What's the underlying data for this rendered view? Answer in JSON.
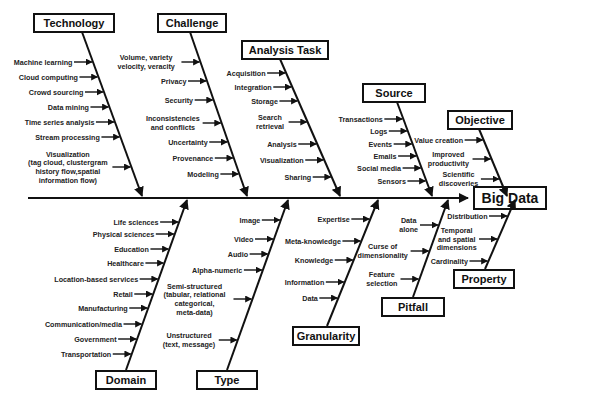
{
  "title": "Big Data",
  "spine": {
    "y": 198,
    "x_start": 28,
    "x_end": 468
  },
  "head": {
    "label": "Big Data",
    "x": 474,
    "y": 187,
    "w": 72,
    "h": 22
  },
  "top_categories": [
    {
      "label": "Technology",
      "box": [
        34,
        14,
        80,
        18
      ],
      "bone": [
        82,
        32,
        142,
        196
      ],
      "items": [
        {
          "lines": [
            "Machine learning"
          ],
          "y": 62
        },
        {
          "lines": [
            "Cloud computing"
          ],
          "y": 77
        },
        {
          "lines": [
            "Crowd sourcing"
          ],
          "y": 92
        },
        {
          "lines": [
            "Data mining"
          ],
          "y": 107
        },
        {
          "lines": [
            "Time series analysis"
          ],
          "y": 122
        },
        {
          "lines": [
            "Stream processing"
          ],
          "y": 137
        },
        {
          "lines": [
            "Visualization",
            "(tag cloud, clustergram",
            "history flow,spatial",
            "information flow)"
          ],
          "y": 167
        }
      ]
    },
    {
      "label": "Challenge",
      "box": [
        158,
        14,
        68,
        18
      ],
      "bone": [
        190,
        32,
        247,
        196
      ],
      "items": [
        {
          "lines": [
            "Volume, variety",
            "velocity, veracity"
          ],
          "y": 62
        },
        {
          "lines": [
            "Privacy"
          ],
          "y": 81
        },
        {
          "lines": [
            "Security"
          ],
          "y": 100
        },
        {
          "lines": [
            "Inconsistencies",
            "and conflicts"
          ],
          "y": 123
        },
        {
          "lines": [
            "Uncertainty"
          ],
          "y": 142
        },
        {
          "lines": [
            "Provenance"
          ],
          "y": 158
        },
        {
          "lines": [
            "Modeling"
          ],
          "y": 174
        }
      ]
    },
    {
      "label": "Analysis Task",
      "box": [
        242,
        41,
        86,
        18
      ],
      "bone": [
        280,
        59,
        340,
        196
      ],
      "items": [
        {
          "lines": [
            "Acquisition"
          ],
          "y": 73
        },
        {
          "lines": [
            "Integration"
          ],
          "y": 87
        },
        {
          "lines": [
            "Storage"
          ],
          "y": 101
        },
        {
          "lines": [
            "Search",
            "retrieval"
          ],
          "y": 122
        },
        {
          "lines": [
            "Analysis"
          ],
          "y": 144
        },
        {
          "lines": [
            "Visualization"
          ],
          "y": 160
        },
        {
          "lines": [
            "Sharing"
          ],
          "y": 177
        }
      ]
    },
    {
      "label": "Source",
      "box": [
        363,
        84,
        62,
        18
      ],
      "bone": [
        397,
        102,
        432,
        196
      ],
      "items": [
        {
          "lines": [
            "Transactions"
          ],
          "y": 119
        },
        {
          "lines": [
            "Logs"
          ],
          "y": 131
        },
        {
          "lines": [
            "Events"
          ],
          "y": 144
        },
        {
          "lines": [
            "Emails"
          ],
          "y": 156
        },
        {
          "lines": [
            "Social media"
          ],
          "y": 168
        },
        {
          "lines": [
            "Sensors"
          ],
          "y": 181
        }
      ]
    },
    {
      "label": "Objective",
      "box": [
        448,
        111,
        64,
        18
      ],
      "bone": [
        479,
        129,
        507,
        196
      ],
      "items": [
        {
          "lines": [
            "Value creation"
          ],
          "y": 140
        },
        {
          "lines": [
            "Improved",
            "productivity"
          ],
          "y": 159
        },
        {
          "lines": [
            "Scientific",
            "discoveries"
          ],
          "y": 179
        }
      ]
    }
  ],
  "bottom_categories": [
    {
      "label": "Domain",
      "box": [
        96,
        371,
        60,
        18
      ],
      "bone": [
        126,
        370,
        187,
        200
      ],
      "items": [
        {
          "lines": [
            "Life sciences"
          ],
          "y": 222
        },
        {
          "lines": [
            "Physical sciences"
          ],
          "y": 234
        },
        {
          "lines": [
            "Education"
          ],
          "y": 249
        },
        {
          "lines": [
            "Healthcare"
          ],
          "y": 263
        },
        {
          "lines": [
            "Location-based services"
          ],
          "y": 279
        },
        {
          "lines": [
            "Retail"
          ],
          "y": 294
        },
        {
          "lines": [
            "Manufacturing"
          ],
          "y": 308
        },
        {
          "lines": [
            "Communication/media"
          ],
          "y": 324
        },
        {
          "lines": [
            "Government"
          ],
          "y": 339
        },
        {
          "lines": [
            "Transportation"
          ],
          "y": 354
        }
      ]
    },
    {
      "label": "Type",
      "box": [
        197,
        371,
        60,
        18
      ],
      "bone": [
        227,
        370,
        288,
        200
      ],
      "items": [
        {
          "lines": [
            "Image"
          ],
          "y": 220
        },
        {
          "lines": [
            "Video"
          ],
          "y": 239
        },
        {
          "lines": [
            "Audio"
          ],
          "y": 254
        },
        {
          "lines": [
            "Alpha-numeric"
          ],
          "y": 270
        },
        {
          "lines": [
            "Semi-structured",
            "(tabular, relational",
            "categorical,",
            "meta-data)"
          ],
          "y": 299
        },
        {
          "lines": [
            "Unstructured",
            "(text, message)"
          ],
          "y": 340
        }
      ]
    },
    {
      "label": "Granularity",
      "box": [
        293,
        327,
        66,
        18
      ],
      "bone": [
        327,
        326,
        378,
        200
      ],
      "items": [
        {
          "lines": [
            "Expertise"
          ],
          "y": 219
        },
        {
          "lines": [
            "Meta-knowledge"
          ],
          "y": 241
        },
        {
          "lines": [
            "Knowledge"
          ],
          "y": 260
        },
        {
          "lines": [
            "Information"
          ],
          "y": 282
        },
        {
          "lines": [
            "Data"
          ],
          "y": 298
        }
      ]
    },
    {
      "label": "Pitfall",
      "box": [
        382,
        298,
        62,
        18
      ],
      "bone": [
        413,
        297,
        448,
        200
      ],
      "items": [
        {
          "lines": [
            "Data",
            "alone"
          ],
          "y": 225
        },
        {
          "lines": [
            "Curse of",
            "dimensionality"
          ],
          "y": 251
        },
        {
          "lines": [
            "Feature",
            "selection"
          ],
          "y": 279
        }
      ]
    },
    {
      "label": "Property",
      "box": [
        454,
        270,
        60,
        18
      ],
      "bone": [
        485,
        269,
        515,
        200
      ],
      "items": [
        {
          "lines": [
            "Distribution"
          ],
          "y": 216
        },
        {
          "lines": [
            "Temporal",
            "and spatial",
            "dimensions"
          ],
          "y": 239
        },
        {
          "lines": [
            "Cardinality"
          ],
          "y": 261
        }
      ]
    }
  ]
}
